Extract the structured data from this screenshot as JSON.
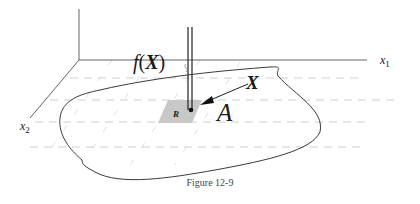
{
  "figure": {
    "caption": "Figure 12-9",
    "labels": {
      "x1_axis": "x",
      "x1_sub": "1",
      "x2_axis": "x",
      "x2_sub": "2",
      "function_label": "f(X)",
      "function_f": "f",
      "function_open": "(",
      "function_arg": "X",
      "function_close": ")",
      "point_label": "X",
      "region_label": "A",
      "patch_label": "R"
    },
    "colors": {
      "patch_fill": "#c8c8c8",
      "axis": "#555555",
      "grid": "#c8c8c8",
      "outline": "#3a3a3a"
    }
  }
}
